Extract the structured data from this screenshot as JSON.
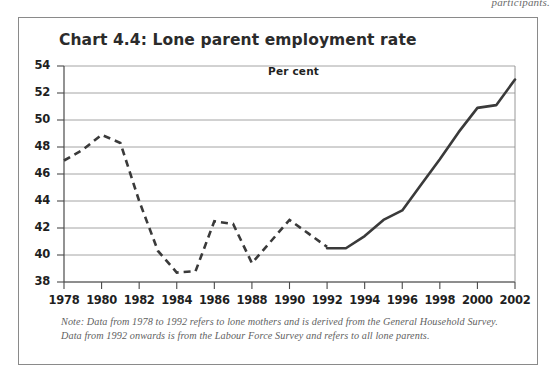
{
  "page": {
    "running_head_fragment": "participants."
  },
  "chart_panel": {
    "title": "Chart 4.4: Lone parent employment rate",
    "axis_unit_label": "Per cent",
    "note_line_1": "Note: Data from 1978 to 1992 refers to lone mothers and is derived from the General Household Survey.",
    "note_line_2": "Data from 1992 onwards is from the Labour Force Survey and refers to all lone parents."
  },
  "chart_data": {
    "type": "line",
    "title": "Chart 4.4: Lone parent employment rate",
    "xlabel": "",
    "ylabel": "Per cent",
    "xlim": [
      1978,
      2002
    ],
    "ylim": [
      38,
      54
    ],
    "ytick_labels": [
      "38",
      "40",
      "42",
      "44",
      "46",
      "48",
      "50",
      "52",
      "54"
    ],
    "yticks": [
      38,
      40,
      42,
      44,
      46,
      48,
      50,
      52,
      54
    ],
    "xtick_labels": [
      "1978",
      "1980",
      "1982",
      "1984",
      "1986",
      "1988",
      "1990",
      "1992",
      "1994",
      "1996",
      "1998",
      "2000",
      "2002"
    ],
    "xticks": [
      1978,
      1980,
      1982,
      1984,
      1986,
      1988,
      1990,
      1992,
      1994,
      1996,
      1998,
      2000,
      2002
    ],
    "grid": true,
    "grid_axis": "y",
    "legend": false,
    "line_color": "#3a3a3a",
    "series": [
      {
        "name": "Lone mothers (General Household Survey)",
        "style": "dashed",
        "x": [
          1978,
          1979,
          1980,
          1981,
          1982,
          1983,
          1984,
          1985,
          1986,
          1987,
          1988,
          1989,
          1990,
          1991,
          1992
        ],
        "values": [
          47.0,
          47.8,
          48.9,
          48.3,
          44.0,
          40.3,
          38.7,
          38.8,
          42.5,
          42.3,
          39.4,
          41.0,
          42.6,
          41.6,
          40.6
        ]
      },
      {
        "name": "All lone parents (Labour Force Survey)",
        "style": "solid",
        "x": [
          1992,
          1993,
          1994,
          1995,
          1996,
          1997,
          1998,
          1999,
          2000,
          2001,
          2002
        ],
        "values": [
          40.5,
          40.5,
          41.4,
          42.6,
          43.3,
          45.2,
          47.1,
          49.1,
          50.9,
          51.1,
          53.0
        ]
      }
    ]
  }
}
